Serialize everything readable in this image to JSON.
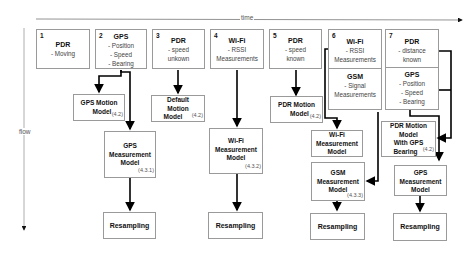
{
  "axes": {
    "time_label": "time",
    "flow_label": "flow"
  },
  "columns": [
    {
      "num": "1",
      "title": "PDR",
      "lines": [
        "- Moving"
      ]
    },
    {
      "num": "2",
      "title": "GPS",
      "lines": [
        "- Position",
        "- Speed",
        "- Bearing"
      ],
      "motion_model": {
        "l1": "GPS Motion",
        "l2": "Model",
        "ref": "(4.2)"
      },
      "measurement_model": {
        "l1": "GPS",
        "l2": "Measurement",
        "l3": "Model",
        "ref": "(4.3.1)"
      },
      "resampling": "Resampling"
    },
    {
      "num": "3",
      "title": "PDR",
      "lines": [
        "- speed",
        "unkown"
      ],
      "motion_model": {
        "l1": "Default",
        "l2": "Motion",
        "l3": "Model",
        "ref": "(4.2)"
      }
    },
    {
      "num": "4",
      "title": "Wi-Fi",
      "lines": [
        "- RSSI",
        "Measurements"
      ],
      "measurement_model": {
        "l1": "Wi-Fi",
        "l2": "Measurement",
        "l3": "Model",
        "ref": "(4.3.2)"
      },
      "resampling": "Resampling"
    },
    {
      "num": "5",
      "title": "PDR",
      "lines": [
        "- speed",
        "known"
      ],
      "motion_model": {
        "l1": "PDR Motion",
        "l2": "Model",
        "ref": "(4.2)"
      }
    },
    {
      "num": "6",
      "title": "Wi-Fi",
      "lines": [
        "- RSSI",
        "Measurements"
      ],
      "title2": "GSM",
      "lines2": [
        "- Signal",
        "Measurements"
      ],
      "wifi_model": {
        "l1": "Wi-Fi",
        "l2": "Measurement",
        "l3": "Model"
      },
      "gsm_model": {
        "l1": "GSM",
        "l2": "Measurement",
        "l3": "Model",
        "ref": "(4.3.3)"
      },
      "resampling": "Resampling"
    },
    {
      "num": "7",
      "title": "PDR",
      "lines": [
        "- distance",
        "known"
      ],
      "title2": "GPS",
      "lines2": [
        "- Position",
        "- Speed",
        "- Bearing"
      ],
      "motion_model": {
        "l1": "PDR Motion",
        "l2": "Model",
        "l3": "With GPS",
        "l4": "Bearing",
        "ref": "(4.2)"
      },
      "measurement_model": {
        "l1": "GPS",
        "l2": "Measurement",
        "l3": "Model"
      },
      "resampling": "Resampling"
    }
  ]
}
